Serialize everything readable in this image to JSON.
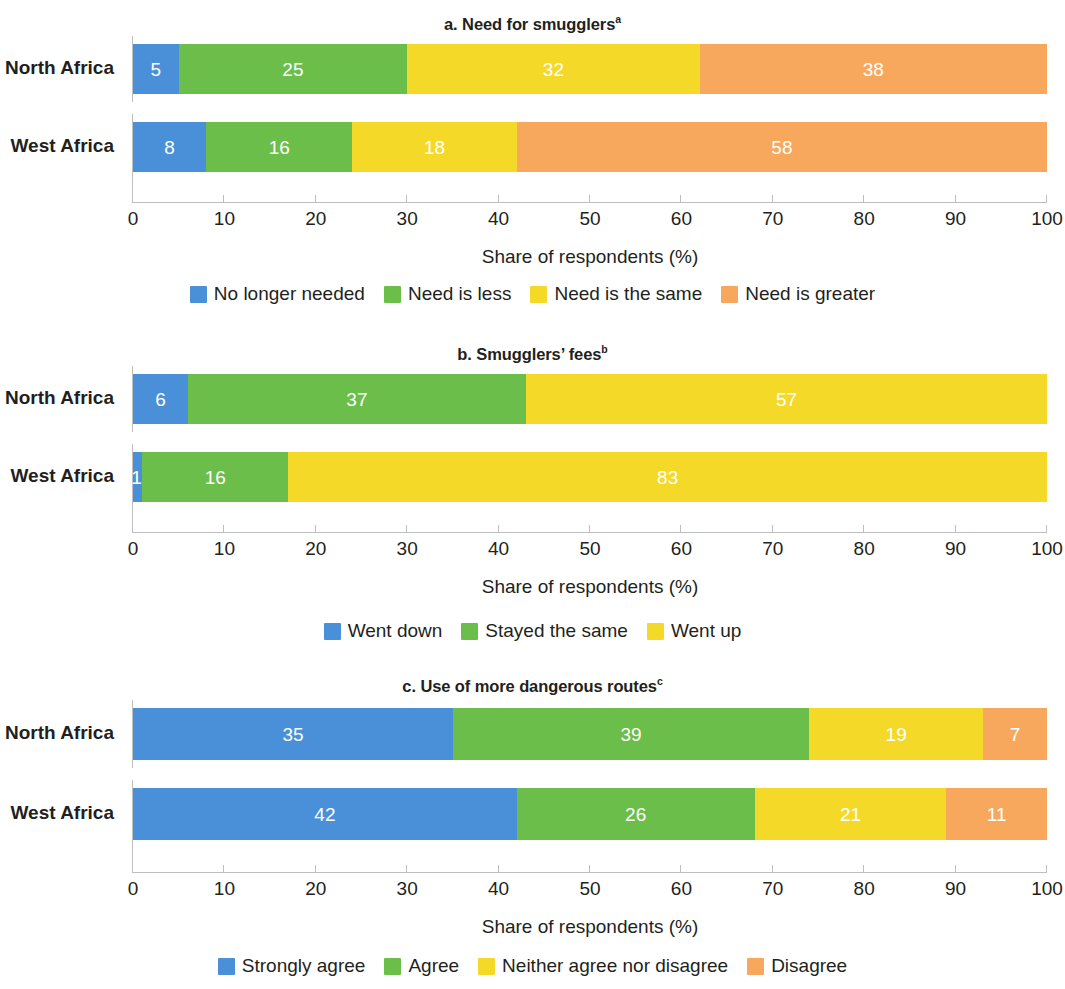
{
  "figure": {
    "axis_title": "Share of respondents (%)",
    "categories": [
      "North Africa",
      "West Africa"
    ],
    "xticks": [
      0,
      10,
      20,
      30,
      40,
      50,
      60,
      70,
      80,
      90,
      100
    ]
  },
  "colors": {
    "blue": "#4a90d9",
    "green": "#6cbe4b",
    "yellow": "#f5d928",
    "orange": "#f7a85c",
    "axis": "#bcbec0",
    "text": "#231f20",
    "label_text": "#ffffff"
  },
  "panels": [
    {
      "id": "a",
      "title": "a. Need for smugglers",
      "title_superscript": "a",
      "legend": [
        {
          "label": "No longer needed",
          "color": "#4a90d9"
        },
        {
          "label": "Need is less",
          "color": "#6cbe4b"
        },
        {
          "label": "Need is the same",
          "color": "#f5d928"
        },
        {
          "label": "Need is greater",
          "color": "#f7a85c"
        }
      ],
      "rows": [
        {
          "category": "North Africa",
          "values": [
            5,
            25,
            32,
            38
          ]
        },
        {
          "category": "West Africa",
          "values": [
            8,
            16,
            18,
            58
          ]
        }
      ]
    },
    {
      "id": "b",
      "title": "b. Smugglers’ fees",
      "title_superscript": "b",
      "legend": [
        {
          "label": "Went down",
          "color": "#4a90d9"
        },
        {
          "label": "Stayed the same",
          "color": "#6cbe4b"
        },
        {
          "label": "Went up",
          "color": "#f5d928"
        }
      ],
      "rows": [
        {
          "category": "North Africa",
          "values": [
            6,
            37,
            57
          ]
        },
        {
          "category": "West Africa",
          "values": [
            1,
            16,
            83
          ]
        }
      ]
    },
    {
      "id": "c",
      "title": "c. Use of more dangerous routes",
      "title_superscript": "c",
      "legend": [
        {
          "label": "Strongly agree",
          "color": "#4a90d9"
        },
        {
          "label": "Agree",
          "color": "#6cbe4b"
        },
        {
          "label": "Neither agree nor disagree",
          "color": "#f5d928"
        },
        {
          "label": "Disagree",
          "color": "#f7a85c"
        }
      ],
      "rows": [
        {
          "category": "North Africa",
          "values": [
            35,
            39,
            19,
            7
          ]
        },
        {
          "category": "West Africa",
          "values": [
            42,
            26,
            21,
            11
          ]
        }
      ]
    }
  ],
  "chart_data": {
    "type": "bar",
    "orientation": "horizontal",
    "stacked": true,
    "stack_mode": "percent",
    "grid": false,
    "legend_position": "bottom",
    "xlabel": "Share of respondents (%)",
    "ylabel": "",
    "xlim": [
      0,
      100
    ],
    "xticks": [
      0,
      10,
      20,
      30,
      40,
      50,
      60,
      70,
      80,
      90,
      100
    ],
    "categories": [
      "North Africa",
      "West Africa"
    ],
    "panels": [
      {
        "panel": "a",
        "title": "a. Need for smugglers",
        "title_superscript": "a",
        "series": [
          {
            "name": "No longer needed",
            "color": "#4a90d9",
            "values": [
              5,
              8
            ]
          },
          {
            "name": "Need is less",
            "color": "#6cbe4b",
            "values": [
              25,
              16
            ]
          },
          {
            "name": "Need is the same",
            "color": "#f5d928",
            "values": [
              32,
              18
            ]
          },
          {
            "name": "Need is greater",
            "color": "#f7a85c",
            "values": [
              38,
              58
            ]
          }
        ]
      },
      {
        "panel": "b",
        "title": "b. Smugglers’ fees",
        "title_superscript": "b",
        "series": [
          {
            "name": "Went down",
            "color": "#4a90d9",
            "values": [
              6,
              1
            ]
          },
          {
            "name": "Stayed the same",
            "color": "#6cbe4b",
            "values": [
              37,
              16
            ]
          },
          {
            "name": "Went up",
            "color": "#f5d928",
            "values": [
              57,
              83
            ]
          }
        ]
      },
      {
        "panel": "c",
        "title": "c. Use of more dangerous routes",
        "title_superscript": "c",
        "series": [
          {
            "name": "Strongly agree",
            "color": "#4a90d9",
            "values": [
              35,
              42
            ]
          },
          {
            "name": "Agree",
            "color": "#6cbe4b",
            "values": [
              39,
              26
            ]
          },
          {
            "name": "Neither agree nor disagree",
            "color": "#f5d928",
            "values": [
              19,
              21
            ]
          },
          {
            "name": "Disagree",
            "color": "#f7a85c",
            "values": [
              7,
              11
            ]
          }
        ]
      }
    ]
  }
}
